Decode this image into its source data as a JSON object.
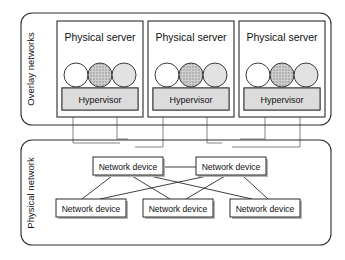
{
  "diagram": {
    "zones": [
      {
        "id": "overlay",
        "label": "Overlay networks"
      },
      {
        "id": "physical",
        "label": "Physical network"
      }
    ],
    "servers": [
      {
        "label": "Physical server",
        "hypervisor_label": "Hypervisor",
        "vms": [
          {
            "name": "vm-white",
            "fill": "#ffffff"
          },
          {
            "name": "vm-dark",
            "fill": "#b9b9b9"
          },
          {
            "name": "vm-light",
            "fill": "#e2e2e2"
          }
        ]
      },
      {
        "label": "Physical server",
        "hypervisor_label": "Hypervisor",
        "vms": [
          {
            "name": "vm-white",
            "fill": "#ffffff"
          },
          {
            "name": "vm-dark",
            "fill": "#b9b9b9"
          },
          {
            "name": "vm-light",
            "fill": "#e2e2e2"
          }
        ]
      },
      {
        "label": "Physical server",
        "hypervisor_label": "Hypervisor",
        "vms": [
          {
            "name": "vm-white",
            "fill": "#ffffff"
          },
          {
            "name": "vm-dark",
            "fill": "#b9b9b9"
          },
          {
            "name": "vm-light",
            "fill": "#e2e2e2"
          }
        ]
      }
    ],
    "network_devices": {
      "label": "Network device",
      "top": [
        {
          "label": "Network device"
        },
        {
          "label": "Network device"
        }
      ],
      "bottom": [
        {
          "label": "Network device"
        },
        {
          "label": "Network device"
        },
        {
          "label": "Network device"
        }
      ]
    },
    "colors": {
      "outline": "#2b2b2b",
      "hypervisor_fill": "#dcdcdc",
      "vm_dark_fill": "#b9b9b9",
      "vm_light_fill": "#e2e2e2",
      "shadow": "#b4b4b4",
      "connector": "#6d6d6d",
      "background": "#ffffff"
    }
  }
}
